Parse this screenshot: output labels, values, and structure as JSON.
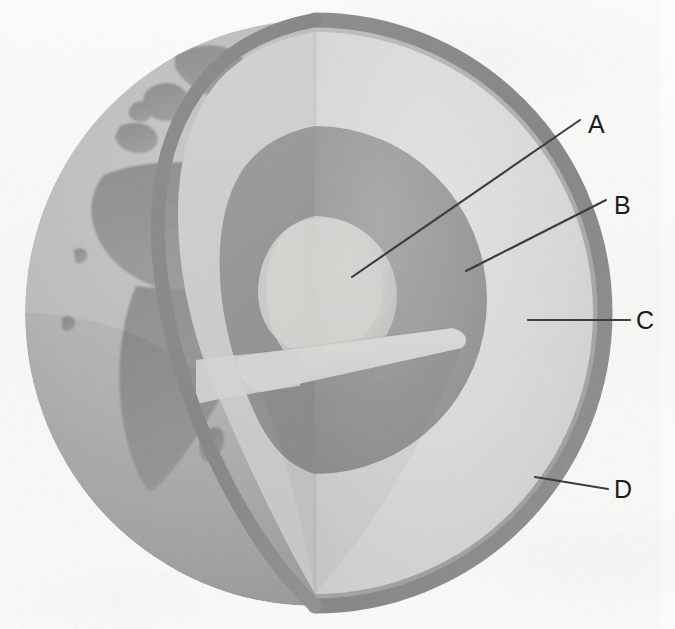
{
  "figure": {
    "background_color": "#fbfbfa",
    "kind": "labeled-science-diagram"
  },
  "labels": [
    {
      "id": "A",
      "text": "A",
      "points_to": "inner-core",
      "x": 592,
      "y": 124
    },
    {
      "id": "B",
      "text": "B",
      "points_to": "outer-core",
      "x": 618,
      "y": 205
    },
    {
      "id": "C",
      "text": "C",
      "points_to": "mantle",
      "x": 640,
      "y": 320
    },
    {
      "id": "D",
      "text": "D",
      "points_to": "crust",
      "x": 618,
      "y": 489
    }
  ],
  "leader_lines": [
    {
      "id": "A",
      "x1": 352,
      "y1": 277,
      "x2": 580,
      "y2": 120
    },
    {
      "id": "B",
      "x1": 466,
      "y1": 271,
      "x2": 606,
      "y2": 200
    },
    {
      "id": "C",
      "x1": 528,
      "y1": 320,
      "x2": 630,
      "y2": 320
    },
    {
      "id": "D",
      "x1": 535,
      "y1": 477,
      "x2": 608,
      "y2": 489
    }
  ],
  "earth_layers": [
    {
      "name": "crust",
      "label": "D",
      "color": "#8e8e8e"
    },
    {
      "name": "mantle",
      "label": "C",
      "color": "#d6d6d4"
    },
    {
      "name": "outer-core",
      "label": "B",
      "color": "#9a9a98"
    },
    {
      "name": "inner-core",
      "label": "A",
      "color": "#cfcfcc"
    }
  ],
  "globe": {
    "surface_ocean_color": "#b4b4b2",
    "surface_land_color": "#909090",
    "center_x": 315,
    "center_y": 313,
    "radius_x": 290,
    "radius_y": 293,
    "continents_visible": "Europe, Africa, Mediterranean"
  },
  "colors": {
    "line": "#2a2a2a",
    "label_text": "#1c1c1c",
    "page_background": "#fbfbfa"
  }
}
